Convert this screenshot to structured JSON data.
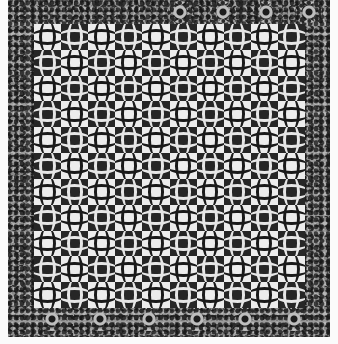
{
  "image": {
    "subject": "Quilt",
    "description": "Black-and-white photograph of a pieced quilt with interlocking curved blocks in a checkerboard arrangement, surrounded by a printed floral chintz border with medallion rosettes.",
    "colors": {
      "background": "#fbfbfb",
      "light_block": "#ececec",
      "dark_block": "#262626",
      "border_base": "#9a9a9a"
    }
  },
  "field": {
    "columns": 10,
    "rows": 11,
    "top_left": "light",
    "pattern": "checkerboard of concave-sided squares with lens-shaped arcs at the junctions"
  },
  "border": {
    "style": "floral print",
    "top_rosettes": 4,
    "bottom_rosettes": 6
  }
}
